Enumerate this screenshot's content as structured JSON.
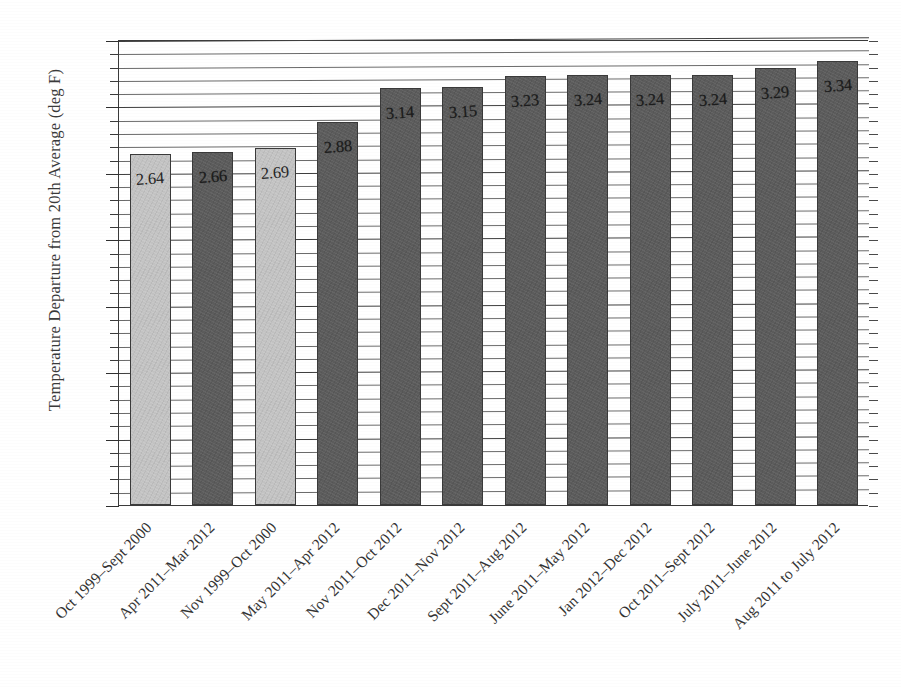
{
  "chart_data": {
    "type": "bar",
    "title": "",
    "subtitle": "",
    "xlabel": "",
    "ylabel": "Temperature Departure from 20th Average (deg F)",
    "ylim": [
      0.0,
      3.5
    ],
    "ytick_labels": [
      "0.00",
      "0.50",
      "1.00",
      "1.50",
      "2.00",
      "2.50",
      "3.00",
      "3.50"
    ],
    "ytick_values": [
      0.0,
      0.5,
      1.0,
      1.5,
      2.0,
      2.5,
      3.0,
      3.5
    ],
    "minor_tick_step": 0.1,
    "grid": "horizontal",
    "legend": "none",
    "categories": [
      "Oct 1999–Sept 2000",
      "Apr 2011–Mar 2012",
      "Nov 1999–Oct 2000",
      "May 2011–Apr 2012",
      "Nov 2011–Oct 2012",
      "Dec 2011–Nov 2012",
      "Sept 2011–Aug 2012",
      "June 2011–May 2012",
      "Jan 2012–Dec 2012",
      "Oct 2011–Sept 2012",
      "July 2011–June 2012",
      "Aug 2011 to July 2012"
    ],
    "values": [
      2.64,
      2.66,
      2.69,
      2.88,
      3.14,
      3.15,
      3.23,
      3.24,
      3.24,
      3.24,
      3.29,
      3.34
    ],
    "value_labels": [
      "2.64",
      "2.66",
      "2.69",
      "2.88",
      "3.14",
      "3.15",
      "3.23",
      "3.24",
      "3.24",
      "3.24",
      "3.29",
      "3.34"
    ],
    "bar_styles": [
      "light",
      "dark",
      "light",
      "dark",
      "dark",
      "dark",
      "dark",
      "dark",
      "dark",
      "dark",
      "dark",
      "dark"
    ],
    "colors": {
      "bar_light": "#c3c3c3",
      "bar_dark": "#5c5c5c",
      "bar_edge": "#3a3a3a",
      "axis": "#3a3a3a",
      "gridline": "#5a5a5a",
      "text": "#333333",
      "background": "#ffffff"
    }
  },
  "caption": {
    "trace_text": ""
  }
}
